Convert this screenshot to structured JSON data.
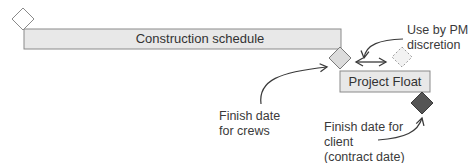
{
  "diagram": {
    "bars": {
      "construction": {
        "label": "Construction schedule"
      },
      "float": {
        "label": "Project Float"
      }
    },
    "annotations": {
      "pm": {
        "line1": "Use by PM",
        "line2": "discretion"
      },
      "crews": {
        "line1": "Finish date",
        "line2": "for crews"
      },
      "client": {
        "line1": "Finish date for",
        "line2": "client",
        "line3": "(contract date)"
      }
    },
    "milestones": [
      {
        "name": "start",
        "style": "outline"
      },
      {
        "name": "finish-for-crews",
        "style": "light-filled"
      },
      {
        "name": "pm-discretion",
        "style": "dashed"
      },
      {
        "name": "finish-for-client",
        "style": "dark-filled"
      }
    ],
    "colors": {
      "bar_fill": "#e8e8e8",
      "bar_stroke": "#8a8a8a",
      "dark_milestone": "#555555",
      "light_milestone": "#dcdcdc",
      "text": "#3a3a3a"
    }
  }
}
